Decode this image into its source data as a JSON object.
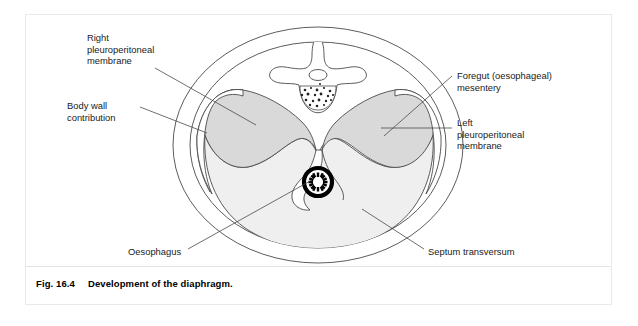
{
  "figure": {
    "caption_number": "Fig. 16.4",
    "caption_text": "Development of the diaphragm."
  },
  "labels": {
    "right_pleuroperitoneal_membrane": "Right\npleuroperitoneal\nmembrane",
    "body_wall_contribution": "Body wall\ncontribution",
    "foregut_mesentery": "Foregut (oesophageal)\nmesentery",
    "left_pleuroperitoneal_membrane": "Left\npleuroperitoneal\nmembrane",
    "oesophagus": "Oesophagus",
    "septum_transversum": "Septum transversum"
  },
  "structures": [
    {
      "name": "outer-body-wall-ellipse",
      "描述": "outermost oval outline of the embryo trunk"
    },
    {
      "name": "inner-body-wall-ellipse",
      "描述": "inner oval outline just inside the body wall"
    },
    {
      "name": "vertebra",
      "描述": "vertebral body with spinous process, transverse processes, vertebral foramen and speckled centrum"
    },
    {
      "name": "right-pleuroperitoneal-membrane",
      "描述": "shaded wing on the viewer's left"
    },
    {
      "name": "left-pleuroperitoneal-membrane",
      "描述": "shaded wing on the viewer's right"
    },
    {
      "name": "septum-transversum",
      "描述": "large pale central mass forming the floor"
    },
    {
      "name": "oesophagus",
      "描述": "dark ringed tube with stellate lumen at the centre"
    },
    {
      "name": "foregut-mesentery",
      "描述": "narrow strand descending to the oesophagus"
    }
  ],
  "colors": {
    "membrane_fill": "#d9d9d9",
    "septum_fill": "#efefef",
    "line": "#3a3a3a",
    "oesophagus_ring": "#000000",
    "frame": "#e9e9e9",
    "background": "#ffffff"
  }
}
